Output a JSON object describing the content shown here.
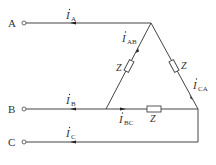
{
  "diagram": {
    "type": "three-phase delta-connected load",
    "terminals": [
      {
        "label": "A"
      },
      {
        "label": "B"
      },
      {
        "label": "C"
      }
    ],
    "line_currents": [
      {
        "symbol": "I",
        "sub": "A"
      },
      {
        "symbol": "I",
        "sub": "B"
      },
      {
        "symbol": "I",
        "sub": "C"
      }
    ],
    "phase_currents": [
      {
        "symbol": "I",
        "sub": "AB"
      },
      {
        "symbol": "I",
        "sub": "BC"
      },
      {
        "symbol": "I",
        "sub": "CA"
      }
    ],
    "impedances": [
      {
        "label": "Z"
      },
      {
        "label": "Z"
      },
      {
        "label": "Z"
      }
    ]
  }
}
